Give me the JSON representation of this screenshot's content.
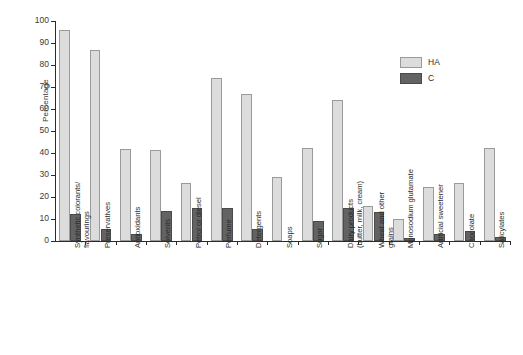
{
  "chart_data": {
    "type": "bar",
    "title": "",
    "xlabel": "",
    "ylabel": "Percentage",
    "ylim": [
      0,
      100
    ],
    "ytick_step": 10,
    "yticks": [
      0,
      10,
      20,
      30,
      40,
      50,
      60,
      70,
      80,
      90,
      100
    ],
    "ytick_labels": [
      "0",
      "10",
      "20",
      "30",
      "40",
      "50",
      "60",
      "70",
      "80",
      "90",
      "100"
    ],
    "grid": false,
    "legend_position": "upper right",
    "colors": {
      "HA": "#dcdcdc",
      "C": "#636363",
      "axis": "#2b2b2b",
      "text": "#2b2b2b"
    },
    "categories": [
      "Synthetic colorants/\nflavourings",
      "Preservatives",
      "Antioxidants",
      "Solvents",
      "Petrol or diesel",
      "Perfume",
      "Detergents",
      "Soaps",
      "Sugar",
      "Dairy products\n(butter, milk, cream)",
      "Wheat and other\ngrains",
      "Monosodium glutamate",
      "Artificial sweetener",
      "Chocolate",
      "Salicylates"
    ],
    "series": [
      {
        "name": "HA",
        "values": [
          96,
          87,
          42,
          41.5,
          26.5,
          74,
          67,
          29,
          42.5,
          64,
          16,
          10,
          24.5,
          26.5,
          42.5
        ]
      },
      {
        "name": "C",
        "values": [
          12.5,
          5.5,
          3,
          13.5,
          15,
          15,
          5.5,
          0,
          9,
          15,
          13,
          1.5,
          3,
          4.5,
          2
        ]
      }
    ],
    "legend": [
      {
        "label": "HA",
        "color": "#dcdcdc"
      },
      {
        "label": "C",
        "color": "#636363"
      }
    ]
  }
}
